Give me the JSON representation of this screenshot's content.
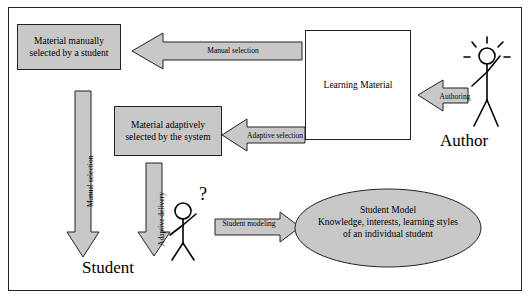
{
  "diagram": {
    "boxes": {
      "material_manual": "Material manually selected by a student",
      "material_adaptive": "Material adaptively selected by the system",
      "learning_material": "Learning Material"
    },
    "ellipse": {
      "title": "Student Model",
      "line1": "Knowledge, interests, learning styles",
      "line2": "of an individual student"
    },
    "actors": {
      "student": "Student",
      "author": "Author"
    },
    "arrow_labels": {
      "manual_selection_top": "Manual selection",
      "adaptive_selection": "Adaptive selection",
      "authoring": "Authoring",
      "manual_selection_left": "Manual selection",
      "adaptive_delivery": "Adaptive delivery",
      "student_modeling": "Student modeling"
    },
    "colors": {
      "box_fill": "#c8c8c8",
      "box_fill_white": "#ffffff",
      "arrow_fill": "#c8c8c8",
      "ellipse_fill": "#c8c8c8",
      "stroke": "#222222",
      "frame": "#222222"
    }
  }
}
